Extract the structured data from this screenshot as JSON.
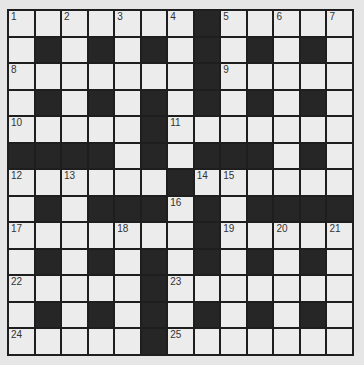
{
  "puzzle": {
    "rows": 13,
    "cols": 13,
    "grid": [
      "WWWWWWWBWWWWW",
      "WBWBWBWBWBWBW",
      "WWWWWWWBWWWWW",
      "WBWBWBWBWBWBW",
      "WWWWWBWWWWWWW",
      "BBBBWBWBBBWBW",
      "WWWWWWBWWWWWW",
      "WBWBBBWBWBBBB",
      "WWWWWWWBWWWWW",
      "WBWBWBWBWBWBW",
      "WWWWWBWWWWWWW",
      "WBWBWBWBWBWBW",
      "WWWWWBWWWWWWW"
    ],
    "numbers": [
      {
        "r": 0,
        "c": 0,
        "n": "1"
      },
      {
        "r": 0,
        "c": 2,
        "n": "2"
      },
      {
        "r": 0,
        "c": 4,
        "n": "3"
      },
      {
        "r": 0,
        "c": 6,
        "n": "4"
      },
      {
        "r": 0,
        "c": 8,
        "n": "5"
      },
      {
        "r": 0,
        "c": 10,
        "n": "6"
      },
      {
        "r": 0,
        "c": 12,
        "n": "7"
      },
      {
        "r": 2,
        "c": 0,
        "n": "8"
      },
      {
        "r": 2,
        "c": 8,
        "n": "9"
      },
      {
        "r": 4,
        "c": 0,
        "n": "10"
      },
      {
        "r": 4,
        "c": 6,
        "n": "11"
      },
      {
        "r": 6,
        "c": 0,
        "n": "12"
      },
      {
        "r": 6,
        "c": 2,
        "n": "13"
      },
      {
        "r": 6,
        "c": 7,
        "n": "14"
      },
      {
        "r": 6,
        "c": 8,
        "n": "15"
      },
      {
        "r": 7,
        "c": 6,
        "n": "16"
      },
      {
        "r": 8,
        "c": 0,
        "n": "17"
      },
      {
        "r": 8,
        "c": 4,
        "n": "18"
      },
      {
        "r": 8,
        "c": 8,
        "n": "19"
      },
      {
        "r": 8,
        "c": 10,
        "n": "20"
      },
      {
        "r": 8,
        "c": 12,
        "n": "21"
      },
      {
        "r": 10,
        "c": 0,
        "n": "22"
      },
      {
        "r": 10,
        "c": 6,
        "n": "23"
      },
      {
        "r": 12,
        "c": 0,
        "n": "24"
      },
      {
        "r": 12,
        "c": 6,
        "n": "25"
      }
    ]
  }
}
